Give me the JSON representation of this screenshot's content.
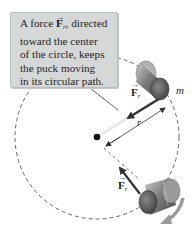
{
  "callout": {
    "lines": [
      {
        "pre": "A force ",
        "vector": "F",
        "sub": "r",
        "post": ", directed"
      },
      {
        "text": "toward the center"
      },
      {
        "text": "of the circle, keeps"
      },
      {
        "text": "the puck moving"
      },
      {
        "text": "in its circular path."
      }
    ]
  },
  "labels": {
    "mass": "m",
    "radius": "r",
    "force_top": {
      "vector": "F",
      "sub": "r"
    },
    "force_bottom": {
      "vector": "F",
      "sub": "r"
    }
  },
  "colors": {
    "callout_bg": "#d6d8d8",
    "arrow": "#3a3a3a",
    "puck": "#6a6a6a",
    "circle": "#555555"
  }
}
